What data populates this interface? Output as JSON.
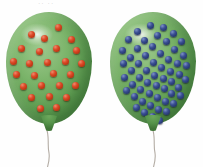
{
  "figure": {
    "title": "Two green balloons containing differing numbers of colored particles",
    "background_color": "#ffffff",
    "width": 203,
    "height": 167,
    "top_artifact_text": "·· ··"
  },
  "balloons": [
    {
      "id": "left-balloon",
      "label": "Left balloon",
      "balloon_color": "#7bb46a",
      "particle_color": "#c0341f",
      "particle_label": "red particle",
      "particle_count": 26,
      "density": "low",
      "position": {
        "x": 6,
        "y": 12
      },
      "size": {
        "width": 86,
        "height": 112
      },
      "knot": {
        "x": 46,
        "y": 124
      },
      "string": {
        "x": 34,
        "y": 127,
        "color": "#b3aca4"
      },
      "particles": [
        {
          "x": 49,
          "y": 12
        },
        {
          "x": 22,
          "y": 19
        },
        {
          "x": 35,
          "y": 23
        },
        {
          "x": 62,
          "y": 24
        },
        {
          "x": 12,
          "y": 33
        },
        {
          "x": 30,
          "y": 36
        },
        {
          "x": 47,
          "y": 33
        },
        {
          "x": 67,
          "y": 35
        },
        {
          "x": 4,
          "y": 46
        },
        {
          "x": 20,
          "y": 48
        },
        {
          "x": 38,
          "y": 47
        },
        {
          "x": 56,
          "y": 46
        },
        {
          "x": 72,
          "y": 48
        },
        {
          "x": 7,
          "y": 59
        },
        {
          "x": 25,
          "y": 60
        },
        {
          "x": 44,
          "y": 58
        },
        {
          "x": 61,
          "y": 59
        },
        {
          "x": 14,
          "y": 71
        },
        {
          "x": 32,
          "y": 70
        },
        {
          "x": 50,
          "y": 70
        },
        {
          "x": 66,
          "y": 70
        },
        {
          "x": 22,
          "y": 82
        },
        {
          "x": 40,
          "y": 81
        },
        {
          "x": 57,
          "y": 82
        },
        {
          "x": 31,
          "y": 93
        },
        {
          "x": 47,
          "y": 92
        }
      ]
    },
    {
      "id": "right-balloon",
      "label": "Right balloon",
      "balloon_color": "#7bb46a",
      "particle_color": "#2a3f7a",
      "particle_label": "blue particle",
      "particle_count": 56,
      "density": "high",
      "position": {
        "x": 110,
        "y": 12
      },
      "size": {
        "width": 86,
        "height": 112
      },
      "knot": {
        "x": 150,
        "y": 124
      },
      "string": {
        "x": 140,
        "y": 127,
        "color": "#b3aca4"
      },
      "particles": [
        {
          "x": 37,
          "y": 10
        },
        {
          "x": 50,
          "y": 12
        },
        {
          "x": 24,
          "y": 16
        },
        {
          "x": 60,
          "y": 18
        },
        {
          "x": 44,
          "y": 20
        },
        {
          "x": 15,
          "y": 24
        },
        {
          "x": 31,
          "y": 25
        },
        {
          "x": 53,
          "y": 26
        },
        {
          "x": 68,
          "y": 26
        },
        {
          "x": 24,
          "y": 33
        },
        {
          "x": 39,
          "y": 31
        },
        {
          "x": 61,
          "y": 34
        },
        {
          "x": 9,
          "y": 35
        },
        {
          "x": 47,
          "y": 38
        },
        {
          "x": 32,
          "y": 40
        },
        {
          "x": 17,
          "y": 42
        },
        {
          "x": 70,
          "y": 40
        },
        {
          "x": 55,
          "y": 44
        },
        {
          "x": 40,
          "y": 47
        },
        {
          "x": 25,
          "y": 48
        },
        {
          "x": 10,
          "y": 48
        },
        {
          "x": 64,
          "y": 48
        },
        {
          "x": 48,
          "y": 52
        },
        {
          "x": 33,
          "y": 55
        },
        {
          "x": 18,
          "y": 55
        },
        {
          "x": 73,
          "y": 50
        },
        {
          "x": 57,
          "y": 56
        },
        {
          "x": 41,
          "y": 60
        },
        {
          "x": 26,
          "y": 62
        },
        {
          "x": 11,
          "y": 62
        },
        {
          "x": 66,
          "y": 59
        },
        {
          "x": 50,
          "y": 63
        },
        {
          "x": 34,
          "y": 67
        },
        {
          "x": 19,
          "y": 69
        },
        {
          "x": 58,
          "y": 66
        },
        {
          "x": 72,
          "y": 64
        },
        {
          "x": 43,
          "y": 70
        },
        {
          "x": 27,
          "y": 74
        },
        {
          "x": 13,
          "y": 75
        },
        {
          "x": 51,
          "y": 73
        },
        {
          "x": 65,
          "y": 72
        },
        {
          "x": 36,
          "y": 78
        },
        {
          "x": 21,
          "y": 81
        },
        {
          "x": 58,
          "y": 78
        },
        {
          "x": 44,
          "y": 82
        },
        {
          "x": 29,
          "y": 86
        },
        {
          "x": 67,
          "y": 80
        },
        {
          "x": 52,
          "y": 86
        },
        {
          "x": 37,
          "y": 90
        },
        {
          "x": 23,
          "y": 92
        },
        {
          "x": 60,
          "y": 88
        },
        {
          "x": 45,
          "y": 94
        },
        {
          "x": 31,
          "y": 97
        },
        {
          "x": 53,
          "y": 96
        },
        {
          "x": 39,
          "y": 101
        },
        {
          "x": 46,
          "y": 105
        }
      ]
    }
  ]
}
